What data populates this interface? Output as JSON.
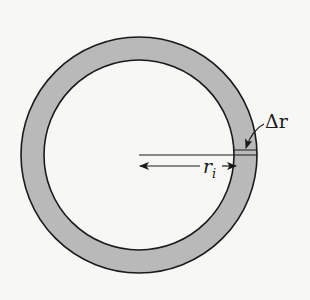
{
  "figure": {
    "type": "annular-ring-cross-section",
    "colors": {
      "background": "#f7f7f5",
      "ring_fill": "#b9b9b9",
      "stroke": "#1a1a1a",
      "inner_fill": "#f7f7f5"
    },
    "geometry": {
      "center": [
        139,
        155
      ],
      "outer_radius": 118,
      "inner_radius": 95
    },
    "labels": {
      "inner_radius": {
        "symbol": "r",
        "subscript": "i"
      },
      "thickness": {
        "symbol": "Δr"
      }
    }
  }
}
